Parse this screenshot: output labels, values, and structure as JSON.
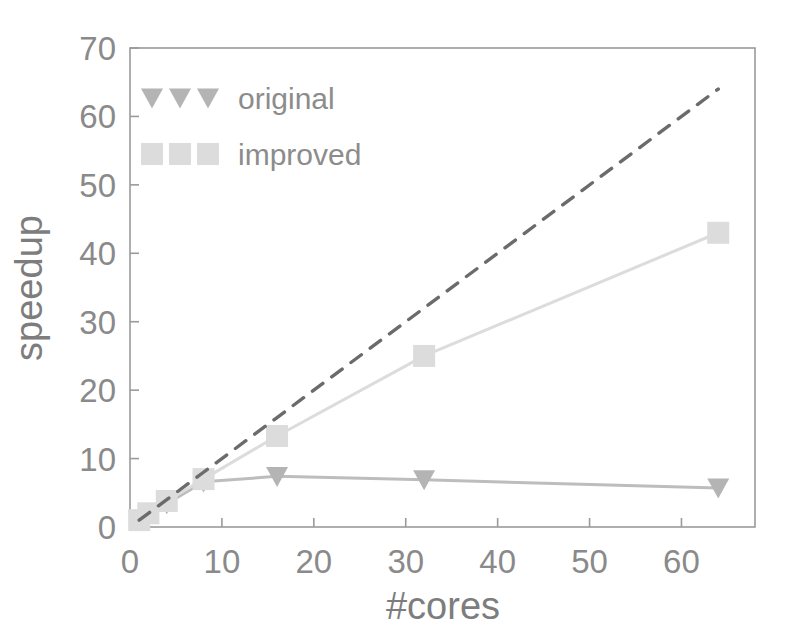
{
  "chart_data": {
    "type": "line",
    "title": "",
    "xlabel": "#cores",
    "ylabel": "speedup",
    "xlim": [
      0,
      68
    ],
    "ylim": [
      0,
      70
    ],
    "xticks": [
      0,
      10,
      20,
      30,
      40,
      50,
      60
    ],
    "yticks": [
      0,
      10,
      20,
      30,
      40,
      50,
      60,
      70
    ],
    "xtick_labels": [
      "0",
      "10",
      "20",
      "30",
      "40",
      "50",
      "60"
    ],
    "ytick_labels": [
      "0",
      "10",
      "20",
      "30",
      "40",
      "50",
      "60",
      "70"
    ],
    "grid": false,
    "legend_position": "upper left",
    "x": [
      1,
      2,
      4,
      8,
      16,
      32,
      64
    ],
    "series": [
      {
        "name": "original",
        "marker": "triangle-down",
        "color": "#b4b4b4",
        "line_color": "#bdbdbd",
        "linestyle": "solid",
        "values": [
          1.0,
          1.8,
          3.4,
          6.6,
          7.4,
          6.9,
          5.7
        ]
      },
      {
        "name": "improved",
        "marker": "square",
        "color": "#dcdcdc",
        "line_color": "#dcdcdc",
        "linestyle": "solid",
        "values": [
          1.0,
          2.0,
          3.8,
          7.0,
          13.3,
          25.0,
          43.0
        ]
      },
      {
        "name": "ideal",
        "marker": "none",
        "color": "#6b6b6b",
        "line_color": "#6b6b6b",
        "linestyle": "dashed",
        "values": [
          1,
          2,
          4,
          8,
          16,
          32,
          64
        ]
      }
    ],
    "legend": [
      {
        "label": "original",
        "marker": "triangle-down",
        "color": "#b4b4b4"
      },
      {
        "label": "improved",
        "marker": "square",
        "color": "#dcdcdc"
      }
    ],
    "frame_color": "#9a9a9a",
    "background": "#ffffff"
  }
}
